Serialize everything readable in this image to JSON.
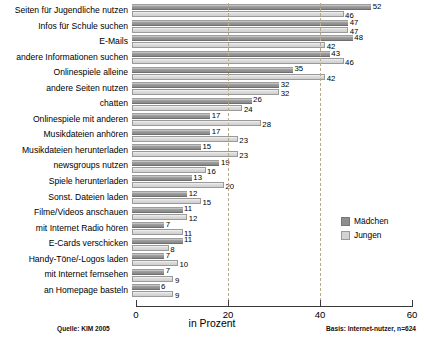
{
  "chart_data": {
    "type": "bar",
    "orientation": "horizontal",
    "title": "",
    "xlabel": "in Prozent",
    "ylabel": "",
    "xlim": [
      0,
      60
    ],
    "xticks": [
      0,
      20,
      40,
      60
    ],
    "grid": "vertical-dashed-at-20-40",
    "legend_position": "right-middle",
    "categories": [
      "Seiten für Jugendliche nutzen",
      "Infos für Schule suchen",
      "E-Mails",
      "andere Informationen suchen",
      "Onlinespiele alleine",
      "andere Seiten nutzen",
      "chatten",
      "Onlinespiele mit anderen",
      "Musikdateien anhören",
      "Musikdateien herunterladen",
      "newsgroups nutzen",
      "Spiele herunterladen",
      "Sonst. Dateien laden",
      "Filme/Videos anschauen",
      "mit Internet Radio hören",
      "E-Cards verschicken",
      "Handy-Töne/-Logos laden",
      "mit Internet fernsehen",
      "an Homepage basteln"
    ],
    "series": [
      {
        "name": "Mädchen",
        "color": "#8e8e8e",
        "values": [
          52,
          47,
          48,
          43,
          35,
          32,
          26,
          17,
          17,
          15,
          19,
          13,
          12,
          11,
          7,
          11,
          7,
          7,
          6
        ]
      },
      {
        "name": "Jungen",
        "color": "#d3d3d3",
        "values": [
          46,
          47,
          42,
          46,
          42,
          32,
          24,
          28,
          23,
          23,
          16,
          20,
          15,
          12,
          11,
          8,
          10,
          9,
          9
        ]
      }
    ]
  },
  "legend": {
    "items": [
      {
        "label": "Mädchen"
      },
      {
        "label": "Jungen"
      }
    ]
  },
  "axis": {
    "title": "in Prozent",
    "ticks": [
      "0",
      "20",
      "40",
      "60"
    ]
  },
  "footnotes": {
    "source": "Quelle: KIM 2005",
    "basis": "Basis: Internet-nutzer, n=624"
  }
}
